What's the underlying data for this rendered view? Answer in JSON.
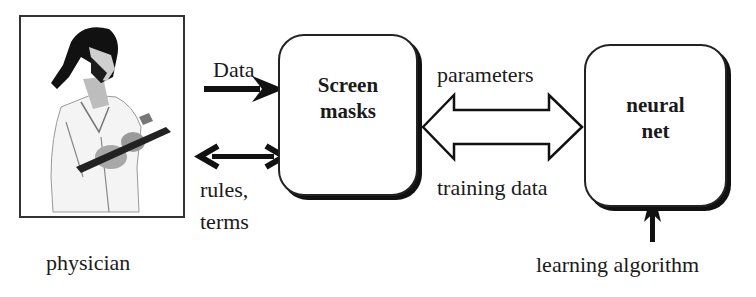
{
  "diagram": {
    "physician": {
      "label": "physician",
      "icon": "physician-with-clipboard"
    },
    "screen_masks": {
      "line1": "Screen",
      "line2": "masks"
    },
    "neural_net": {
      "line1": "neural",
      "line2": "net"
    },
    "arrows": {
      "data": "Data",
      "rules_terms_line1": "rules,",
      "rules_terms_line2": "terms",
      "parameters": "parameters",
      "training_data": "training data",
      "learning_algorithm": "learning algorithm"
    }
  }
}
